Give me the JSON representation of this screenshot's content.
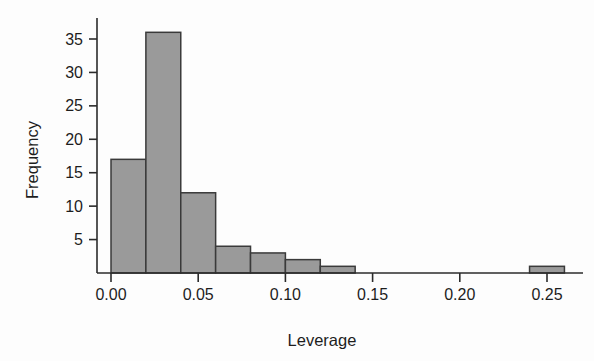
{
  "chart_data": {
    "type": "bar",
    "title": "",
    "subtitle": "",
    "xlabel": "Leverage",
    "ylabel": "Frequency",
    "xlim": [
      -0.005,
      0.275
    ],
    "ylim": [
      0,
      38
    ],
    "grid": false,
    "legend": null,
    "bin_width": 0.02,
    "xticks": [
      0.0,
      0.05,
      0.1,
      0.15,
      0.2,
      0.25
    ],
    "xticklabels": [
      "0.00",
      "0.05",
      "0.10",
      "0.15",
      "0.20",
      "0.25"
    ],
    "yticks": [
      5,
      10,
      15,
      20,
      25,
      30,
      35
    ],
    "yticklabels": [
      "5",
      "10",
      "15",
      "20",
      "25",
      "30",
      "35"
    ],
    "bar_fill_color": "#9a9a9a",
    "bar_edge_color": "#3a3a3a",
    "axis_color": "#2b2b2b",
    "background_color": "#fdfdfd",
    "bins": [
      {
        "left": 0.0,
        "right": 0.02,
        "value": 17
      },
      {
        "left": 0.02,
        "right": 0.04,
        "value": 36
      },
      {
        "left": 0.04,
        "right": 0.06,
        "value": 12
      },
      {
        "left": 0.06,
        "right": 0.08,
        "value": 4
      },
      {
        "left": 0.08,
        "right": 0.1,
        "value": 3
      },
      {
        "left": 0.1,
        "right": 0.12,
        "value": 2
      },
      {
        "left": 0.12,
        "right": 0.14,
        "value": 1
      },
      {
        "left": 0.24,
        "right": 0.26,
        "value": 1
      }
    ],
    "categories": [
      "0.00-0.02",
      "0.02-0.04",
      "0.04-0.06",
      "0.06-0.08",
      "0.08-0.10",
      "0.10-0.12",
      "0.12-0.14",
      "0.24-0.26"
    ],
    "values": [
      17,
      36,
      12,
      4,
      3,
      2,
      1,
      1
    ]
  }
}
